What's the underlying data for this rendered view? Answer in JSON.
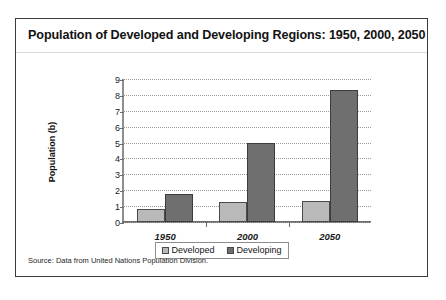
{
  "figure": {
    "title": "Population of Developed and Developing Regions: 1950, 2000, 2050",
    "source_note": "Source: Data from United Nations Population Division."
  },
  "chart_data": {
    "type": "bar",
    "title": "Population of Developed and Developing Regions: 1950, 2000, 2050",
    "xlabel": "",
    "ylabel": "Population (b)",
    "categories": [
      "1950",
      "2000",
      "2050"
    ],
    "series": [
      {
        "name": "Developed",
        "color": "#b9b9b9",
        "values": [
          0.8,
          1.25,
          1.3
        ]
      },
      {
        "name": "Developing",
        "color": "#6f6f6f",
        "values": [
          1.75,
          5.0,
          8.3
        ]
      }
    ],
    "ylim": [
      0,
      9
    ],
    "yticks": [
      "0",
      "1",
      "2",
      "3",
      "4",
      "5",
      "6",
      "7",
      "8",
      "9"
    ],
    "grid": true,
    "legend_position": "bottom"
  }
}
